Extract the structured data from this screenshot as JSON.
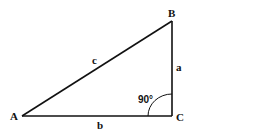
{
  "diagram": {
    "type": "right-triangle",
    "vertices": {
      "A": {
        "label": "A",
        "x": 22,
        "y": 116
      },
      "B": {
        "label": "B",
        "x": 172,
        "y": 21
      },
      "C": {
        "label": "C",
        "x": 172,
        "y": 116
      }
    },
    "sides": {
      "a": {
        "label": "a",
        "from": "B",
        "to": "C"
      },
      "b": {
        "label": "b",
        "from": "A",
        "to": "C"
      },
      "c": {
        "label": "c",
        "from": "A",
        "to": "B"
      }
    },
    "right_angle": {
      "label": "90°",
      "at": "C"
    },
    "colors": {
      "stroke": "#111111",
      "background": "#ffffff"
    }
  }
}
